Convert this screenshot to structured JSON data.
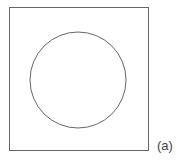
{
  "figure": {
    "label": "(a)",
    "square": {
      "x": 9.5,
      "y": 7.5,
      "width": 139,
      "height": 143,
      "stroke": "#666666"
    },
    "circle": {
      "cx": 78,
      "cy": 80,
      "r": 48,
      "stroke": "#666666"
    }
  }
}
